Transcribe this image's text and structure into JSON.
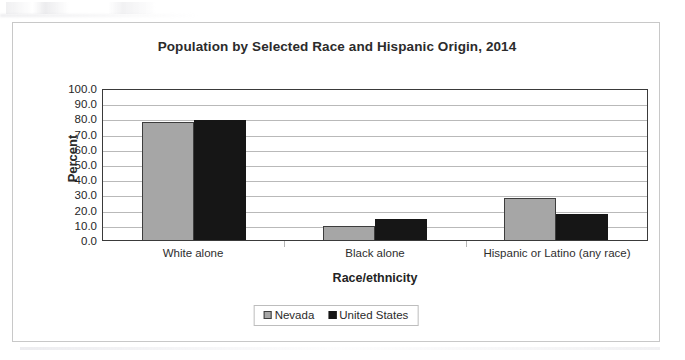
{
  "chart_data": {
    "type": "bar",
    "title": "Population by Selected Race and Hispanic Origin, 2014",
    "xlabel": "Race/ethnicity",
    "ylabel": "Percent",
    "categories": [
      "White alone",
      "Black alone",
      "Hispanic or Latino (any race)"
    ],
    "series": [
      {
        "name": "Nevada",
        "color": "#a6a6a6",
        "values": [
          77.8,
          9.2,
          27.8
        ]
      },
      {
        "name": "United States",
        "color": "#161616",
        "values": [
          79.0,
          13.6,
          17.4
        ]
      }
    ],
    "ylim": [
      0.0,
      100.0
    ],
    "ytick_step": 10.0,
    "yticks": [
      "100.0",
      "90.0",
      "80.0",
      "70.0",
      "60.0",
      "50.0",
      "40.0",
      "30.0",
      "20.0",
      "10.0",
      "0.0"
    ],
    "grid": true,
    "legend_position": "bottom"
  }
}
